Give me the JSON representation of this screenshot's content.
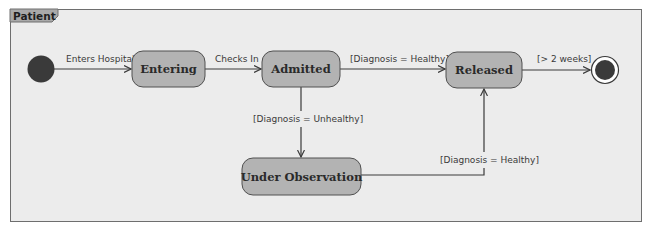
{
  "diagram": {
    "type": "uml-state-machine",
    "frame_label": "Patient",
    "colors": {
      "frame_bg": "#ececec",
      "frame_border": "#6e6e6e",
      "tab_fill": "#a9a9a9",
      "state_fill": "#b3b3b3",
      "state_border": "#505050",
      "pseudo_fill": "#3a3a3a",
      "edge": "#3a3a3a"
    },
    "states": [
      {
        "id": "initial",
        "kind": "initial"
      },
      {
        "id": "entering",
        "label": "Entering"
      },
      {
        "id": "admitted",
        "label": "Admitted"
      },
      {
        "id": "released",
        "label": "Released"
      },
      {
        "id": "under_observation",
        "label": "Under Observation"
      },
      {
        "id": "final",
        "kind": "final"
      }
    ],
    "transitions": [
      {
        "from": "initial",
        "to": "entering",
        "label": "Enters Hospital"
      },
      {
        "from": "entering",
        "to": "admitted",
        "label": "Checks In"
      },
      {
        "from": "admitted",
        "to": "released",
        "label": "[Diagnosis = Healthy]"
      },
      {
        "from": "released",
        "to": "final",
        "label": "[> 2 weeks]"
      },
      {
        "from": "admitted",
        "to": "under_observation",
        "label": "[Diagnosis = Unhealthy]"
      },
      {
        "from": "under_observation",
        "to": "released",
        "label": "[Diagnosis = Healthy]"
      }
    ]
  }
}
